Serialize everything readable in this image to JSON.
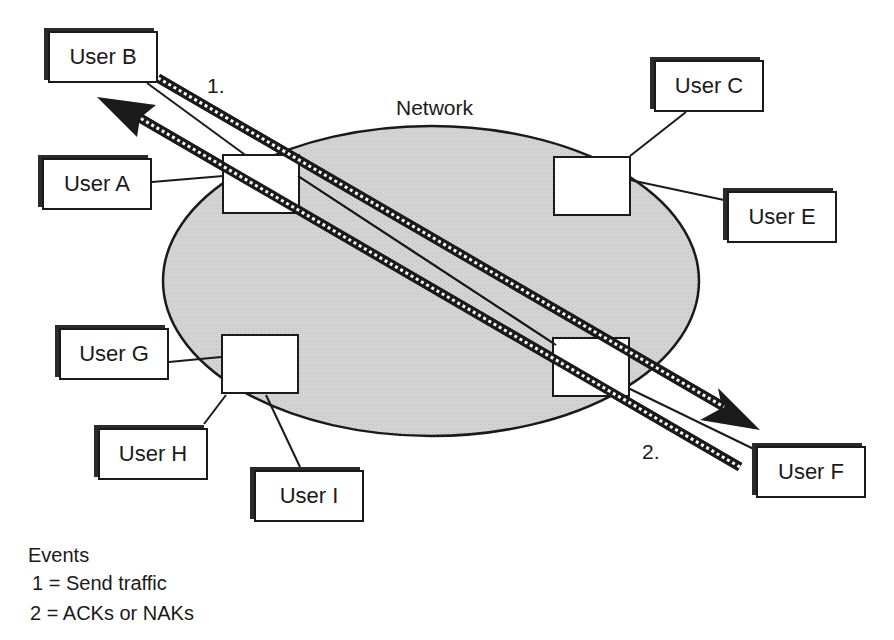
{
  "diagram": {
    "network_label": "Network",
    "users": [
      {
        "id": "B",
        "label": "User B"
      },
      {
        "id": "A",
        "label": "User A"
      },
      {
        "id": "C",
        "label": "User C"
      },
      {
        "id": "E",
        "label": "User E"
      },
      {
        "id": "G",
        "label": "User G"
      },
      {
        "id": "H",
        "label": "User H"
      },
      {
        "id": "I",
        "label": "User I"
      },
      {
        "id": "F",
        "label": "User F"
      }
    ],
    "event_markers": {
      "one": "1.",
      "two": "2."
    },
    "colors": {
      "network_fill": "#d4d4d4",
      "line": "#1a1a1a",
      "background": "#ffffff"
    }
  },
  "legend": {
    "title": "Events",
    "items": [
      {
        "label": "1 = Send traffic"
      },
      {
        "label": "2 = ACKs or NAKs"
      }
    ]
  }
}
